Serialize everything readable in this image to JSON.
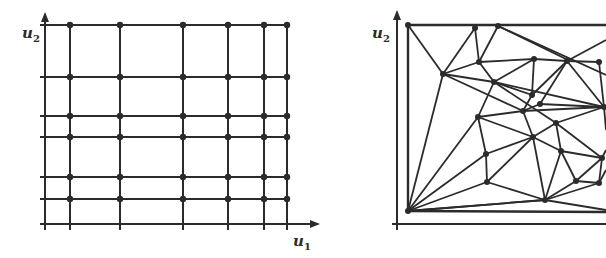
{
  "colors": {
    "ink": "#2b2b2b",
    "background": "#ffffff"
  },
  "left_panel": {
    "title": "Structured grid",
    "x_axis_label": "u",
    "x_axis_sub": "1",
    "y_axis_label": "u",
    "y_axis_sub": "2",
    "grid_x": [
      70,
      120,
      183,
      228,
      264,
      287
    ],
    "grid_y": [
      25,
      77,
      116,
      137,
      177,
      199
    ]
  },
  "right_panel": {
    "title": "Unstructured triangular mesh",
    "y_axis_label": "u",
    "y_axis_sub": "2",
    "nodes": [
      [
        408,
        25
      ],
      [
        475,
        28
      ],
      [
        498,
        26
      ],
      [
        408,
        211
      ],
      [
        443,
        74
      ],
      [
        479,
        62
      ],
      [
        494,
        82
      ],
      [
        534,
        59
      ],
      [
        567,
        61
      ],
      [
        599,
        62
      ],
      [
        532,
        95
      ],
      [
        540,
        104
      ],
      [
        523,
        111
      ],
      [
        478,
        117
      ],
      [
        556,
        123
      ],
      [
        604,
        107
      ],
      [
        533,
        137
      ],
      [
        486,
        154
      ],
      [
        561,
        151
      ],
      [
        602,
        158
      ],
      [
        487,
        182
      ],
      [
        545,
        200
      ],
      [
        576,
        181
      ],
      [
        599,
        183
      ]
    ]
  }
}
